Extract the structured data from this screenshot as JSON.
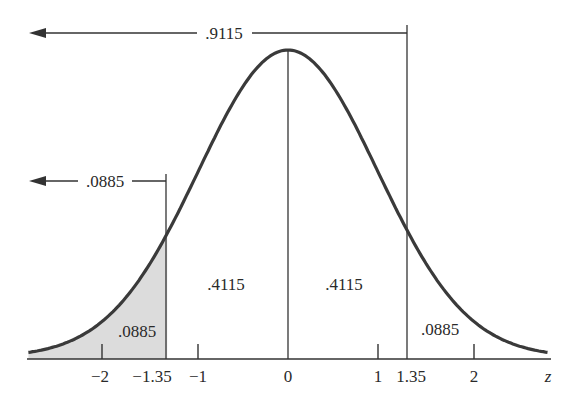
{
  "chart_data": {
    "type": "area",
    "title": "",
    "xlabel": "z",
    "ylabel": "",
    "distribution": "standard normal",
    "xlim": [
      -2.9,
      2.9
    ],
    "x_ticks": [
      -2,
      -1.35,
      -1,
      0,
      1,
      1.35,
      2
    ],
    "x_tick_labels": [
      "−2",
      "−1.35",
      "−1",
      "0",
      "1",
      "1.35",
      "2"
    ],
    "vertical_lines": [
      -1.35,
      0,
      1.35
    ],
    "shaded_region": {
      "from": "-inf",
      "to": -1.35,
      "area": 0.0885
    },
    "regions": [
      {
        "from": "-inf",
        "to": -1.35,
        "area": 0.0885,
        "label": ".0885",
        "shaded": true
      },
      {
        "from": -1.35,
        "to": 0,
        "area": 0.4115,
        "label": ".4115",
        "shaded": false
      },
      {
        "from": 0,
        "to": 1.35,
        "area": 0.4115,
        "label": ".4115",
        "shaded": false
      },
      {
        "from": 1.35,
        "to": "inf",
        "area": 0.0885,
        "label": ".0885",
        "shaded": false
      }
    ],
    "cumulative_arrows": [
      {
        "upto": 1.35,
        "area": 0.9115,
        "label": ".9115"
      },
      {
        "upto": -1.35,
        "area": 0.0885,
        "label": ".0885"
      }
    ],
    "grid": false,
    "legend": null
  },
  "labels": {
    "arrow_top": ".9115",
    "arrow_mid": ".0885",
    "region_left_tail": ".0885",
    "region_left_center": ".4115",
    "region_right_center": ".4115",
    "region_right_tail": ".0885",
    "axis_var": "z",
    "ticks": {
      "m2": "−2",
      "m135": "−1.35",
      "m1": "−1",
      "zero": "0",
      "p1": "1",
      "p135": "1.35",
      "p2": "2"
    }
  },
  "colors": {
    "curve": "#3a3a3a",
    "shade": "#dcdcdc",
    "lines": "#333333"
  }
}
